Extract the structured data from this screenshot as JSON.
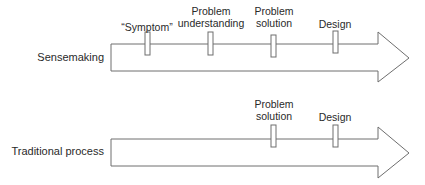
{
  "diagram": {
    "rows": [
      {
        "name": "Sensemaking",
        "label": "Sensemaking",
        "stages": [
          {
            "line1": "",
            "line2": "“Symptom”"
          },
          {
            "line1": "Problem",
            "line2": "understanding"
          },
          {
            "line1": "Problem",
            "line2": "solution"
          },
          {
            "line1": "",
            "line2": "Design"
          }
        ]
      },
      {
        "name": "Traditional process",
        "label": "Traditional process",
        "stages": [
          {
            "line1": "Problem",
            "line2": "solution"
          },
          {
            "line1": "",
            "line2": "Design"
          }
        ]
      }
    ],
    "colors": {
      "stroke": "#6e6e6e",
      "text": "#2a2a2a",
      "background": "#ffffff"
    }
  }
}
